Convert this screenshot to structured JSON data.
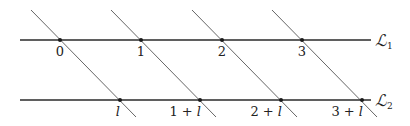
{
  "diagram": {
    "lines": [
      {
        "id": "L1",
        "name": "ℒ",
        "subscript": "1",
        "y": 40,
        "x_start": 20,
        "x_end": 371
      },
      {
        "id": "L2",
        "name": "ℒ",
        "subscript": "2",
        "y": 100,
        "x_start": 20,
        "x_end": 371
      }
    ],
    "top_points": [
      {
        "label": "0",
        "x": 60
      },
      {
        "label": "1",
        "x": 141
      },
      {
        "label": "2",
        "x": 222
      },
      {
        "label": "3",
        "x": 302
      }
    ],
    "bottom_points": [
      {
        "label_num": "",
        "label_var": "l",
        "x": 120
      },
      {
        "label_num": "1 + ",
        "label_var": "l",
        "x": 200
      },
      {
        "label_num": "2 + ",
        "label_var": "l",
        "x": 281
      },
      {
        "label_num": "3 + ",
        "label_var": "l",
        "x": 362
      }
    ],
    "colors": {
      "horizontal": "#2a2a2a",
      "diagonal": "#555555",
      "dot": "#1a1a1a"
    }
  }
}
